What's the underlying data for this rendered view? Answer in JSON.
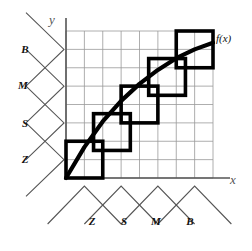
{
  "figure": {
    "background_color": "#ffffff",
    "grid_color": "#999999",
    "axis_color": "#555555",
    "patch_color": "#000000",
    "curve_color": "#000000",
    "mf_color": "#555555"
  },
  "axes": {
    "x_label": "x",
    "y_label": "y",
    "x_label_pos": {
      "x": 233,
      "y": 184
    },
    "y_label_pos": {
      "x": 52,
      "y": 24
    },
    "plot": {
      "left": 66,
      "top": 31,
      "right": 213,
      "bottom": 178
    },
    "grid_cols": 8,
    "grid_rows": 8
  },
  "function_curve": {
    "label": "f(x)",
    "label_pos": {
      "x": 216,
      "y": 42
    },
    "description": "monotonically increasing concave curve from origin to upper right",
    "points": [
      {
        "x": 0.0,
        "y": 0.0
      },
      {
        "x": 0.125,
        "y": 0.21
      },
      {
        "x": 0.25,
        "y": 0.385
      },
      {
        "x": 0.375,
        "y": 0.525
      },
      {
        "x": 0.5,
        "y": 0.64
      },
      {
        "x": 0.625,
        "y": 0.735
      },
      {
        "x": 0.75,
        "y": 0.815
      },
      {
        "x": 0.875,
        "y": 0.875
      },
      {
        "x": 1.0,
        "y": 0.92
      }
    ]
  },
  "fuzzy_patches": [
    {
      "name": "patch-Z-Z",
      "x0": 0,
      "y0": 0,
      "x1": 2,
      "y1": 2
    },
    {
      "name": "patch-S-S",
      "x0": 1.5,
      "y0": 1.5,
      "x1": 3.5,
      "y1": 3.5
    },
    {
      "name": "patch-S-M",
      "x0": 3,
      "y0": 3,
      "x1": 5,
      "y1": 5
    },
    {
      "name": "patch-M-M",
      "x0": 4.5,
      "y0": 4.5,
      "x1": 6.5,
      "y1": 6.5
    },
    {
      "name": "patch-B-B",
      "x0": 6,
      "y0": 6,
      "x1": 8,
      "y1": 8
    }
  ],
  "input_membership": {
    "axis": "x",
    "sets": [
      {
        "label": "Z",
        "label_pos": {
          "x": 92,
          "y": 225
        },
        "peak": 0.125
      },
      {
        "label": "S",
        "label_pos": {
          "x": 124,
          "y": 225
        },
        "peak": 0.375
      },
      {
        "label": "M",
        "label_pos": {
          "x": 156,
          "y": 225
        },
        "peak": 0.625
      },
      {
        "label": "B",
        "label_pos": {
          "x": 190,
          "y": 225
        },
        "peak": 0.875
      }
    ]
  },
  "output_membership": {
    "axis": "y",
    "sets": [
      {
        "label": "Z",
        "label_pos": {
          "x": 25,
          "y": 163
        },
        "peak": 0.125
      },
      {
        "label": "S",
        "label_pos": {
          "x": 25,
          "y": 127
        },
        "peak": 0.375
      },
      {
        "label": "M",
        "label_pos": {
          "x": 23,
          "y": 89
        },
        "peak": 0.625
      },
      {
        "label": "B",
        "label_pos": {
          "x": 25,
          "y": 53
        },
        "peak": 0.875
      }
    ]
  }
}
